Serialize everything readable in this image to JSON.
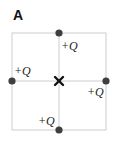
{
  "panel": {
    "label": "A"
  },
  "diagram": {
    "colors": {
      "grid_line": "#cdcdcd",
      "charge_dot": "#3f3f3f",
      "center_mark": "#111111",
      "text": "#222222"
    },
    "square": {
      "x0": 12,
      "y0": 33,
      "x1": 106,
      "y1": 130
    },
    "center": {
      "x": 59,
      "y": 81,
      "marker": "x-mark"
    },
    "charges": [
      {
        "id": "top",
        "x": 59,
        "y": 33,
        "label": "+Q",
        "label_x": 61,
        "label_y": 50
      },
      {
        "id": "left",
        "x": 12,
        "y": 81,
        "label": "+Q",
        "label_x": 14,
        "label_y": 75
      },
      {
        "id": "right",
        "x": 106,
        "y": 81,
        "label": "+Q",
        "label_x": 87,
        "label_y": 96
      },
      {
        "id": "bottom",
        "x": 59,
        "y": 130,
        "label": "+Q",
        "label_x": 38,
        "label_y": 125
      }
    ]
  }
}
